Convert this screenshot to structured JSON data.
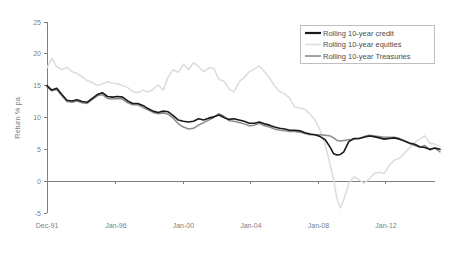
{
  "chart_data": {
    "type": "line",
    "title": "",
    "xlabel": "",
    "ylabel": "Return % pa",
    "ylim": [
      -5,
      25
    ],
    "yticks": [
      -5,
      0,
      5,
      10,
      15,
      20,
      25
    ],
    "ytick_labels": [
      "-5",
      "0",
      "5",
      "10",
      "15",
      "20",
      "25"
    ],
    "xtick_labels": [
      "Dec-91",
      "Jan-96",
      "Jan-00",
      "Jan-04",
      "Jan-08",
      "Jan-12"
    ],
    "xtick_values": [
      1991.92,
      1996.0,
      2000.0,
      2004.0,
      2008.0,
      2012.0
    ],
    "xlim": [
      1991.92,
      2015.2
    ],
    "grid": false,
    "legend_position": "top-right",
    "zero_line": true,
    "series": [
      {
        "name": "Rolling 10-year credit",
        "color": "#1a1a1a",
        "width": 1.6,
        "x": [
          1991.92,
          1992.2,
          1992.5,
          1992.8,
          1993.1,
          1993.4,
          1993.7,
          1994.0,
          1994.3,
          1994.6,
          1994.9,
          1995.2,
          1995.5,
          1995.8,
          1996.1,
          1996.4,
          1996.7,
          1997.0,
          1997.3,
          1997.6,
          1997.9,
          1998.2,
          1998.5,
          1998.8,
          1999.1,
          1999.4,
          1999.7,
          2000.0,
          2000.3,
          2000.6,
          2000.9,
          2001.2,
          2001.5,
          2001.8,
          2002.1,
          2002.4,
          2002.7,
          2003.0,
          2003.3,
          2003.6,
          2003.9,
          2004.2,
          2004.5,
          2004.8,
          2005.1,
          2005.4,
          2005.7,
          2006.0,
          2006.3,
          2006.6,
          2006.9,
          2007.2,
          2007.5,
          2007.8,
          2008.1,
          2008.4,
          2008.7,
          2008.9,
          2009.1,
          2009.3,
          2009.5,
          2009.8,
          2010.1,
          2010.4,
          2010.7,
          2011.0,
          2011.3,
          2011.6,
          2011.9,
          2012.2,
          2012.5,
          2012.8,
          2013.1,
          2013.4,
          2013.7,
          2014.0,
          2014.3,
          2014.6,
          2014.9,
          2015.2
        ],
        "y": [
          15.0,
          14.3,
          14.6,
          13.6,
          12.7,
          12.6,
          12.8,
          12.5,
          12.4,
          13.0,
          13.6,
          13.9,
          13.3,
          13.2,
          13.3,
          13.2,
          12.6,
          12.2,
          12.2,
          11.9,
          11.4,
          11.0,
          10.8,
          11.0,
          10.9,
          10.3,
          9.6,
          9.4,
          9.3,
          9.4,
          9.8,
          9.6,
          9.9,
          10.1,
          10.4,
          10.0,
          9.7,
          9.8,
          9.6,
          9.4,
          9.1,
          9.1,
          9.3,
          9.0,
          8.8,
          8.5,
          8.3,
          8.2,
          8.0,
          8.0,
          7.9,
          7.6,
          7.4,
          7.3,
          7.0,
          6.5,
          5.3,
          4.3,
          4.1,
          4.2,
          4.6,
          6.2,
          6.7,
          6.7,
          6.9,
          7.1,
          7.0,
          6.8,
          6.6,
          6.7,
          6.8,
          6.6,
          6.3,
          6.0,
          5.8,
          5.4,
          5.3,
          5.0,
          5.2,
          5.0
        ]
      },
      {
        "name": "Rolling 10-year equities",
        "color": "#dcdcdc",
        "width": 1.5,
        "x": [
          1991.92,
          1992.2,
          1992.5,
          1992.8,
          1993.1,
          1993.4,
          1993.7,
          1994.0,
          1994.3,
          1994.6,
          1994.9,
          1995.2,
          1995.5,
          1995.8,
          1996.1,
          1996.4,
          1996.7,
          1997.0,
          1997.3,
          1997.6,
          1997.9,
          1998.2,
          1998.5,
          1998.8,
          1999.1,
          1999.4,
          1999.7,
          2000.0,
          2000.3,
          2000.6,
          2000.9,
          2001.2,
          2001.5,
          2001.8,
          2002.1,
          2002.4,
          2002.7,
          2003.0,
          2003.3,
          2003.6,
          2003.9,
          2004.2,
          2004.5,
          2004.8,
          2005.1,
          2005.4,
          2005.7,
          2006.0,
          2006.3,
          2006.6,
          2006.9,
          2007.2,
          2007.5,
          2007.8,
          2008.1,
          2008.4,
          2008.7,
          2008.9,
          2009.1,
          2009.3,
          2009.5,
          2009.8,
          2010.1,
          2010.4,
          2010.7,
          2011.0,
          2011.3,
          2011.6,
          2011.9,
          2012.2,
          2012.5,
          2012.8,
          2013.1,
          2013.4,
          2013.7,
          2014.0,
          2014.3,
          2014.6,
          2014.9,
          2015.2
        ],
        "y": [
          17.8,
          19.3,
          18.0,
          17.5,
          17.9,
          17.2,
          16.9,
          16.4,
          15.8,
          15.5,
          15.0,
          15.3,
          15.6,
          15.4,
          15.3,
          15.0,
          14.7,
          14.1,
          13.9,
          14.3,
          14.0,
          14.4,
          15.1,
          14.3,
          16.4,
          17.5,
          17.1,
          18.4,
          17.5,
          18.6,
          18.0,
          17.2,
          17.8,
          17.7,
          16.0,
          15.7,
          14.5,
          14.0,
          15.6,
          16.3,
          17.2,
          17.6,
          18.1,
          17.2,
          16.2,
          15.0,
          14.1,
          13.7,
          13.0,
          11.6,
          11.5,
          11.3,
          10.5,
          9.6,
          8.0,
          5.8,
          2.5,
          0.2,
          -2.8,
          -4.2,
          -2.9,
          -0.4,
          0.7,
          0.2,
          -0.3,
          0.3,
          1.2,
          1.4,
          1.2,
          2.5,
          3.3,
          3.6,
          4.4,
          5.3,
          6.1,
          6.6,
          7.1,
          6.0,
          5.8,
          5.5
        ]
      },
      {
        "name": "Rolling 10-year Treasuries",
        "color": "#8c8c8c",
        "width": 1.5,
        "x": [
          1991.92,
          1992.2,
          1992.5,
          1992.8,
          1993.1,
          1993.4,
          1993.7,
          1994.0,
          1994.3,
          1994.6,
          1994.9,
          1995.2,
          1995.5,
          1995.8,
          1996.1,
          1996.4,
          1996.7,
          1997.0,
          1997.3,
          1997.6,
          1997.9,
          1998.2,
          1998.5,
          1998.8,
          1999.1,
          1999.4,
          1999.7,
          2000.0,
          2000.3,
          2000.6,
          2000.9,
          2001.2,
          2001.5,
          2001.8,
          2002.1,
          2002.4,
          2002.7,
          2003.0,
          2003.3,
          2003.6,
          2003.9,
          2004.2,
          2004.5,
          2004.8,
          2005.1,
          2005.4,
          2005.7,
          2006.0,
          2006.3,
          2006.6,
          2006.9,
          2007.2,
          2007.5,
          2007.8,
          2008.1,
          2008.4,
          2008.7,
          2008.9,
          2009.1,
          2009.3,
          2009.5,
          2009.8,
          2010.1,
          2010.4,
          2010.7,
          2011.0,
          2011.3,
          2011.6,
          2011.9,
          2012.2,
          2012.5,
          2012.8,
          2013.1,
          2013.4,
          2013.7,
          2014.0,
          2014.3,
          2014.6,
          2014.9,
          2015.2
        ],
        "y": [
          14.8,
          14.2,
          14.4,
          13.4,
          12.5,
          12.4,
          12.6,
          12.3,
          12.2,
          12.8,
          13.4,
          13.6,
          13.0,
          12.9,
          13.0,
          12.9,
          12.3,
          12.0,
          12.0,
          11.6,
          11.2,
          10.8,
          10.6,
          10.7,
          10.5,
          9.9,
          9.0,
          8.5,
          8.2,
          8.3,
          8.8,
          9.2,
          9.6,
          10.0,
          10.6,
          10.2,
          9.5,
          9.4,
          9.2,
          9.0,
          8.7,
          8.8,
          9.1,
          8.7,
          8.5,
          8.2,
          8.0,
          7.9,
          7.8,
          7.8,
          7.7,
          7.5,
          7.3,
          7.3,
          7.3,
          7.2,
          7.1,
          6.8,
          6.4,
          6.3,
          6.4,
          6.5,
          6.6,
          6.7,
          7.0,
          7.2,
          7.1,
          7.0,
          6.9,
          6.9,
          6.9,
          6.7,
          6.3,
          5.9,
          5.6,
          5.3,
          5.6,
          4.9,
          5.2,
          4.6
        ]
      }
    ]
  },
  "legend": {
    "items": [
      {
        "label": "Rolling 10-year credit",
        "color": "#1a1a1a"
      },
      {
        "label": "Rolling 10-year equities",
        "color": "#dcdcdc"
      },
      {
        "label": "Rolling 10-year Treasuries",
        "color": "#8c8c8c"
      }
    ]
  }
}
